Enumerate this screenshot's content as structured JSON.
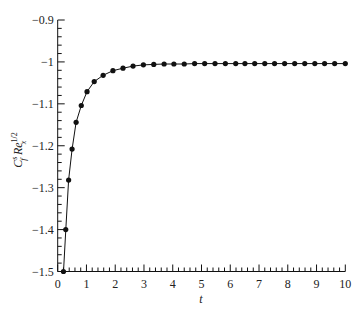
{
  "chart_data": {
    "type": "line",
    "title": "",
    "xlabel": "t",
    "ylabel": "C_f^s Re_x^{1/2}",
    "ylabel_parts": {
      "main": "C",
      "sub1": "f",
      "sup1": "s",
      "mid": " Re",
      "sub2": "x",
      "sup2": "1/2"
    },
    "xlim": [
      0,
      10
    ],
    "ylim": [
      -1.5,
      -0.9
    ],
    "xticks": [
      0,
      1,
      2,
      3,
      4,
      5,
      6,
      7,
      8,
      9,
      10
    ],
    "xtick_labels": [
      "0",
      "1",
      "2",
      "3",
      "4",
      "5",
      "6",
      "7",
      "8",
      "9",
      "10"
    ],
    "yticks": [
      -0.9,
      -1.0,
      -1.1,
      -1.2,
      -1.3,
      -1.4,
      -1.5
    ],
    "ytick_labels": [
      "−0.9",
      "−1",
      "−1.1",
      "−1.2",
      "−1.3",
      "−1.4",
      "−1.5"
    ],
    "grid": false,
    "legend": null,
    "series": [
      {
        "name": "C_f^s Re_x^{1/2}",
        "marker": "circle",
        "color": "#111111",
        "x": [
          0.2,
          0.28,
          0.38,
          0.5,
          0.64,
          0.82,
          1.02,
          1.27,
          1.58,
          1.92,
          2.27,
          2.62,
          2.98,
          3.34,
          3.7,
          4.04,
          4.4,
          4.76,
          5.11,
          5.47,
          5.83,
          6.19,
          6.51,
          6.85,
          7.2,
          7.54,
          7.89,
          8.24,
          8.59,
          8.94,
          9.28,
          9.63,
          10.0
        ],
        "y": [
          -1.5,
          -1.4,
          -1.282,
          -1.208,
          -1.144,
          -1.104,
          -1.071,
          -1.047,
          -1.032,
          -1.021,
          -1.015,
          -1.01,
          -1.007,
          -1.006,
          -1.005,
          -1.005,
          -1.005,
          -1.004,
          -1.004,
          -1.004,
          -1.004,
          -1.004,
          -1.004,
          -1.004,
          -1.004,
          -1.004,
          -1.004,
          -1.004,
          -1.004,
          -1.004,
          -1.004,
          -1.004,
          -1.004
        ]
      }
    ]
  }
}
